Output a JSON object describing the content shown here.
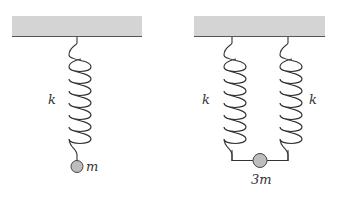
{
  "diagram": {
    "left_system": {
      "spring_label": "k",
      "mass_label": "m",
      "spring_count": 1
    },
    "right_system": {
      "spring_labels": [
        "k",
        "k"
      ],
      "mass_label": "3m",
      "spring_count": 2
    },
    "colors": {
      "ceiling_fill": "#d4d4d4",
      "ceiling_edge": "#555555",
      "spring": "#333333",
      "mass_fill": "#bdbdbd",
      "mass_stroke": "#444444"
    }
  }
}
